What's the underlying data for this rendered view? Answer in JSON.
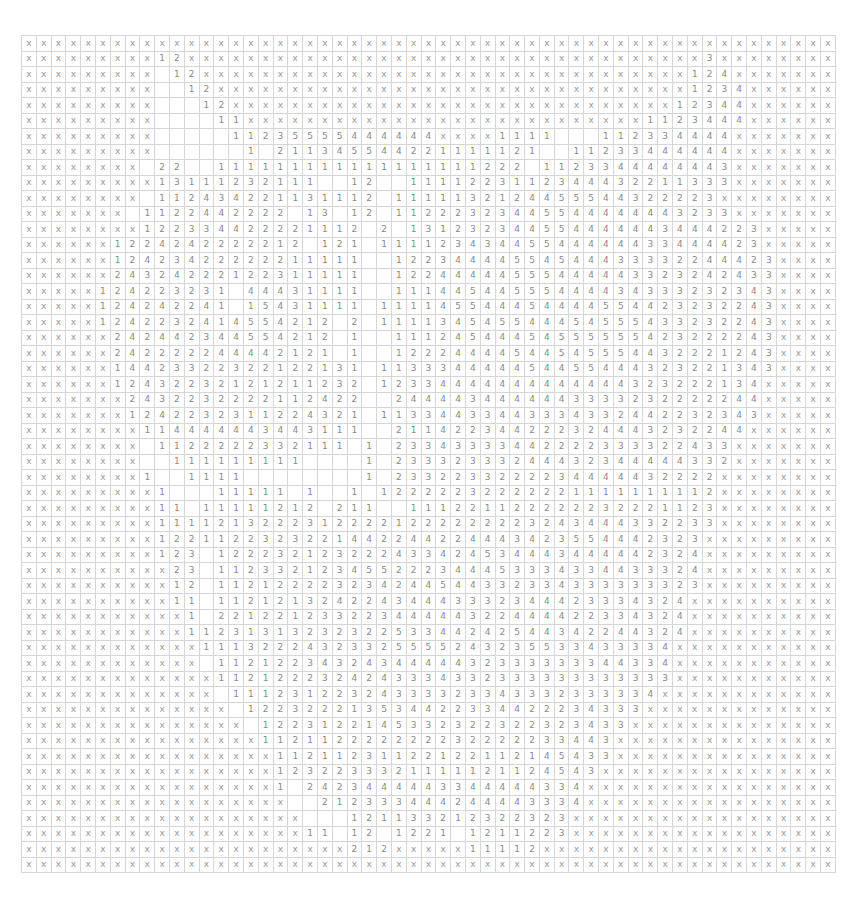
{
  "grid": {
    "columns": 55,
    "rows_count": 54,
    "cell_width": 14.8,
    "cell_height": 15.5,
    "blank_token": ".",
    "mask_token": "x",
    "colors": {
      "line": "#d6d6d6",
      "text": "#8a8a8a",
      "background": "#ffffff"
    },
    "rows": [
      "x x x x x x x x x x x x x x x x x x x x x x x x x x x x x x x x x x x x x x x x x x x x x x x x x x x x x x x",
      "x x x x x x x x x 1 2 x x x x x x x x x x x x x x x x x x x x x x x x x x x x x x x x x x x 3 x x x x x x x",
      "x x x x x x x x x . 1 2 x x x x x x x x x x x x x x x x x x x x x x x x x x x x x x x x x 1 2 4 x x x x x x x",
      "x x x x x x x x x . . 1 2 x x x x x x x x x x x x x x x x x x x x x x x x x x x x x x x x 1 2 3 4 x x x x x x",
      "x x x x x x x x x . . . 1 2 x x x x x x x x x x x x x x x x x x x x x x x x x x x x x x 1 2 3 4 4 x x x x x x",
      "x x x x x x x x x . . . . 1 1 x x x x x x x x x x x x x x x x x x x x x x x x x x x 1 1 2 3 4 4 4 x x x x x x",
      "x x x x x x x x x . . . . . 1 1 2 3 5 5 5 5 4 4 4 4 4 4 x x x x 1 1 1 1 . . . 1 1 2 3 3 4 4 4 4 x x x x x x x",
      "x x x x x x x x x . . . . . . 1 . 2 1 1 3 4 5 5 4 4 2 2 1 1 1 1 1 2 1 . . 1 1 2 3 3 4 4 4 4 4 4 x x x x x x x",
      "x x x x x x x x . 2 2 . . 1 1 1 1 1 1 1 1 1 1 1 1 1 1 1 1 1 1 2 2 2 . 1 1 2 3 3 4 4 4 4 4 4 4 3 x x x x x x x",
      "x x x x x x x x x 1 3 1 1 1 2 3 2 1 1 1 . . 1 2 . . 1 1 1 1 2 2 3 1 1 2 3 4 4 4 3 2 2 1 1 3 3 3 x x x x x x x",
      "x x x x x x x x . 1 1 2 4 3 4 2 2 1 1 3 1 1 1 2 . 1 1 1 1 1 3 2 1 2 4 4 5 5 5 4 4 3 2 2 2 2 3 x x x x x x x",
      "x x x x x x x . 1 1 2 2 4 4 2 2 2 2 . 1 3 . 1 2 . 1 1 2 2 2 3 2 3 4 4 5 5 4 4 4 4 4 4 4 3 2 3 3 x x x x x x",
      "x x x x x x x x 1 2 2 3 3 4 4 2 2 2 2 1 1 1 2 . 2 . 1 3 1 2 3 2 3 4 4 5 5 4 4 4 4 4 4 3 4 4 4 2 2 3 x x x x x",
      "x x x x x x 1 2 2 4 2 4 2 2 2 2 2 1 2 . 1 2 1 . 1 1 1 1 2 3 4 3 4 4 5 5 4 4 4 4 4 4 3 3 4 4 4 4 2 3 x x x x x",
      "x x x x x x 1 2 4 2 3 4 2 2 2 2 2 2 1 1 1 1 1 . . 1 2 2 3 4 4 4 4 5 5 4 5 4 4 4 3 3 3 3 2 2 4 4 4 2 3 x x x x",
      "x x x x x x 2 4 3 2 4 2 2 2 1 2 2 3 1 1 1 1 1 . . 1 2 2 4 4 4 4 4 5 5 5 4 4 4 4 4 3 3 2 3 2 4 2 4 3 3 x x x x",
      "x x x x x 1 2 4 2 2 3 2 3 1 . 4 4 4 3 1 1 1 1 . . 1 1 1 4 4 5 4 4 5 5 5 4 4 4 4 3 4 3 3 3 2 3 2 3 4 3 x x x x",
      "x x x x x 1 2 4 2 4 2 2 4 1 . 1 5 4 3 1 1 1 1 . 1 1 1 1 4 5 5 4 4 4 5 4 4 4 4 5 5 4 4 2 3 2 3 2 2 4 3 x x x x",
      "x x x x x 1 2 4 2 2 3 2 4 1 4 5 5 4 2 1 2 . 2 . 1 1 1 1 3 4 5 4 5 5 4 4 4 5 4 5 5 5 4 3 3 2 3 2 2 4 3 x x x x",
      "x x x x x x 2 4 2 4 4 2 3 4 4 5 5 4 2 1 2 . 1 . . 1 1 1 2 4 5 4 4 4 5 4 5 5 5 5 5 5 4 2 3 2 2 2 2 4 3 x x x x",
      "x x x x x x 2 4 2 2 2 2 2 4 4 4 4 2 1 2 1 . 1 . . 1 2 2 2 4 4 4 4 5 4 4 5 4 5 5 5 4 4 3 2 2 2 1 2 4 3 x x x x",
      "x x x x x x 1 4 4 2 3 3 2 2 3 2 2 1 2 2 1 3 1 . 1 1 3 3 3 4 4 4 4 4 5 4 4 5 5 4 4 4 3 2 3 2 2 1 3 4 3 x x x x",
      "x x x x x x 1 2 4 3 2 2 3 2 1 2 1 2 1 1 2 3 2 . 1 2 3 3 4 4 4 4 4 4 4 4 4 4 4 4 4 3 2 3 2 2 2 1 3 4 x x x x x",
      "x x x x x x x 2 4 3 2 2 3 2 2 2 2 1 1 2 4 2 2 . . 2 4 4 4 4 3 4 4 4 4 4 4 3 3 3 3 2 3 2 2 2 2 2 4 4 x x x x x",
      "x x x x x x x 1 2 4 2 2 3 2 3 1 1 2 2 4 3 2 1 . 1 1 3 3 4 4 3 3 4 4 3 3 3 4 3 3 2 4 4 2 2 3 2 3 4 3 x x x x x",
      "x x x x x x x x 1 1 4 4 4 4 4 4 3 4 4 3 1 1 1 . . 2 1 1 4 2 2 3 4 4 2 2 2 3 2 4 4 4 3 2 3 2 2 4 4 x x x x x x",
      "x x x x x x x x . 1 1 2 2 2 2 2 3 3 2 1 1 1 . 1 . 2 3 3 4 3 3 3 3 4 4 2 2 2 2 3 3 3 3 2 2 4 3 3 x x x x x x x",
      "x x x x x x x x . . 1 1 1 1 1 1 1 1 1 . . . . 1 . 2 3 3 3 2 3 3 3 2 4 4 4 3 2 3 4 4 4 4 4 3 3 2 x x x x x x x",
      "x x x x x x x x 1 . . 1 1 1 1 . . . . . . . . 1 . 2 3 3 2 2 3 3 2 2 2 2 3 4 4 4 4 4 3 2 2 2 2 x x x x x x x x",
      "x x x x x x x x x 1 . . . 1 1 1 1 1 . 1 . . 1 . 1 2 2 2 2 2 3 2 2 2 2 2 2 1 1 1 1 1 1 1 1 1 2 x x x x x x x x",
      "x x x x x x x x x 1 1 . 1 1 1 1 1 2 1 2 . 2 1 1 . . 1 1 1 2 2 1 1 2 2 2 2 2 2 3 2 2 2 1 1 2 3 x x x x x x x x",
      "x x x x x x x x x 1 1 1 1 2 1 3 2 2 2 3 1 2 2 2 2 1 2 2 2 2 2 2 2 2 3 2 4 3 4 4 4 3 3 2 2 3 3 x x x x x x x x",
      "x x x x x x x x x 1 2 2 1 1 2 2 3 2 3 2 2 1 4 4 2 2 4 4 2 2 4 4 4 3 4 2 3 5 5 4 4 4 2 3 2 3 x x x x x x x x x",
      "x x x x x x x x x 1 2 3 . 1 2 2 2 3 2 1 2 3 2 2 2 4 3 3 4 2 4 5 3 4 4 4 3 4 4 4 4 4 2 3 2 4 x x x x x x x x x",
      "x x x x x x x x x x 2 3 . 1 1 2 3 3 2 1 2 3 4 5 5 2 2 2 3 4 4 4 5 3 3 3 4 3 3 4 4 3 3 3 2 4 x x x x x x x x x",
      "x x x x x x x x x x 1 2 . 1 1 2 1 2 2 2 2 3 2 3 4 2 4 4 5 4 4 3 3 2 3 3 4 3 3 3 3 3 3 3 2 3 x x x x x x x x x",
      "x x x x x x x x x x 1 1 . 1 1 2 1 2 1 3 2 4 2 2 4 3 4 4 4 3 3 3 2 3 4 4 4 2 3 3 3 4 3 2 4 x x x x x x x x x x",
      "x x x x x x x x x x x 1 . 2 2 1 2 2 1 2 3 3 2 2 3 4 4 4 4 4 3 2 2 4 4 4 4 2 2 3 3 4 3 2 4 x x x x x x x x x x",
      "x x x x x x x x x x x 1 1 2 3 1 3 1 3 2 3 2 3 2 2 5 3 3 4 4 2 4 2 5 4 4 3 4 2 2 4 4 3 2 4 x x x x x x x x x x",
      "x x x x x x x x x x x x 1 1 1 3 2 2 2 4 3 2 3 3 2 5 5 5 5 2 4 3 2 3 5 5 3 3 4 3 3 3 3 4 x x x x x x x x x x x",
      "x x x x x x x x x x x x . 1 1 2 1 2 2 3 4 3 2 4 3 4 4 4 4 4 3 2 3 3 3 3 3 3 3 4 4 3 3 4 x x x x x x x x x x x",
      "x x x x x x x x x x x x x 1 1 2 1 2 2 2 3 2 4 2 4 3 3 3 4 3 3 2 3 3 3 3 3 3 3 3 3 3 3 3 x x x x x x x x x x x",
      "x x x x x x x x x x x x x . 1 1 1 2 3 1 2 2 3 2 4 3 3 3 3 2 3 3 4 3 3 3 2 3 3 3 3 3 4 x x x x x x x x x x x x",
      "x x x x x x x x x x x x x x . 1 2 2 3 2 2 2 1 3 5 3 4 4 2 2 3 3 4 4 2 2 2 3 4 3 3 3 x x x x x x x x x x x x x",
      "x x x x x x x x x x x x x x x . 1 2 2 3 1 2 2 1 4 5 3 3 2 3 2 2 3 2 2 3 2 3 4 3 3 x x x x x x x x x x x x x x",
      "x x x x x x x x x x x x x x x x 1 1 2 1 1 2 2 2 2 2 2 2 2 3 2 2 2 2 2 3 3 4 4 3 x x x x x x x x x x x x x x x",
      "x x x x x x x x x x x x x x x x x 1 1 2 1 1 2 3 1 1 2 2 1 2 2 1 1 2 1 4 5 4 3 3 x x x x x x x x x x x x x x x",
      "x x x x x x x x x x x x x x x x x 1 2 3 2 2 3 3 3 2 1 1 1 1 1 2 1 1 2 4 5 4 3 x x x x x x x x x x x x x x x x",
      "x x x x x x x x x x x x x x x x x 1 . 2 4 2 3 4 4 4 4 4 3 3 4 4 4 4 4 3 3 4 x x x x x x x x x x x x x x x x x",
      "x x x x x x x x x x x x x x x x x x . . 2 1 2 3 3 3 4 4 4 2 4 4 4 4 3 3 3 4 x x x x x x x x x x x x x x x x x",
      "x x x x x x x x x x x x x x x x x x x . . . 1 2 1 1 3 3 2 1 2 3 2 2 3 2 3 x x x x x x x x x x x x x x x x x x",
      "x x x x x x x x x x x x x x x x x x x 1 1 . 1 2 . 1 2 2 1 . 1 2 1 1 2 2 3 x x x x x x x x x x x x x x x x x x",
      "x x x x x x x x x x x x x x x x x x x x x x 2 1 2 x x x x x 1 1 1 1 2 x x x x x x x x x x x x x x x x x x x x",
      "x x x x x x x x x x x x x x x x x x x x x x x x x x x x x x x x x x x x x x x x x x x x x x x x x x x x x x x"
    ]
  }
}
